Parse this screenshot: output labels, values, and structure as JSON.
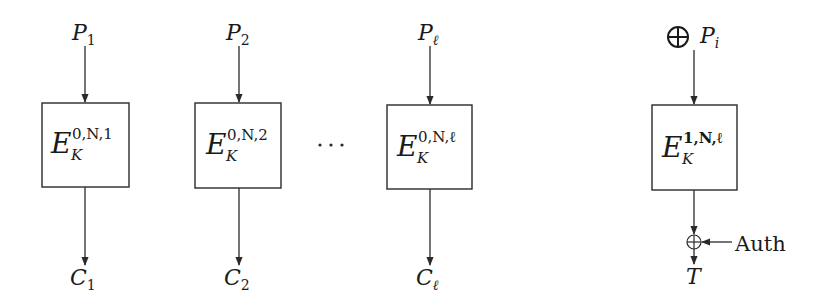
{
  "diagram": {
    "type": "block-cipher-encryption-mode",
    "blocks": [
      {
        "id": "block-1",
        "input": {
          "base": "P",
          "sub": "1"
        },
        "cipher": {
          "base": "E",
          "sub": "K",
          "sup": "0,N,1"
        },
        "output": {
          "base": "C",
          "sub": "1"
        }
      },
      {
        "id": "block-2",
        "input": {
          "base": "P",
          "sub": "2"
        },
        "cipher": {
          "base": "E",
          "sub": "K",
          "sup": "0,N,2"
        },
        "output": {
          "base": "C",
          "sub": "2"
        }
      },
      {
        "id": "block-l",
        "input": {
          "base": "P",
          "sub": "ℓ"
        },
        "cipher": {
          "base": "E",
          "sub": "K",
          "sup": "0,N,ℓ"
        },
        "output": {
          "base": "C",
          "sub": "ℓ"
        }
      },
      {
        "id": "block-tag",
        "input": {
          "prefix": "⊕",
          "base": "P",
          "sub": "i"
        },
        "cipher": {
          "base": "E",
          "sub": "K",
          "sup": "1,N,ℓ"
        },
        "xor_input": "Auth",
        "output": {
          "base": "T",
          "sub": ""
        }
      }
    ],
    "ellipsis": "···"
  }
}
